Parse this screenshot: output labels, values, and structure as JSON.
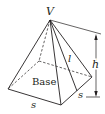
{
  "diagram": {
    "type": "square-pyramid",
    "labels": {
      "apex": "V",
      "base": "Base",
      "side_bottom": "s",
      "side_right": "s",
      "slant_height": "l",
      "height": "h"
    },
    "colors": {
      "stroke": "#231f20",
      "background": "#ffffff"
    }
  }
}
